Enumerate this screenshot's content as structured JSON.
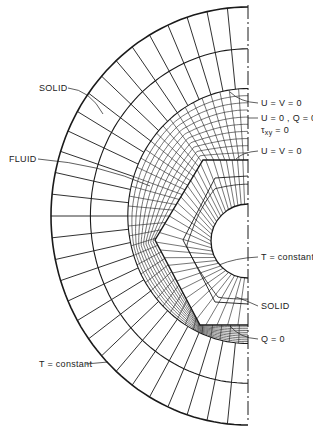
{
  "figure": {
    "colors": {
      "line": "#1a1a1a",
      "background": "#ffffff",
      "text": "#222222"
    },
    "geometry": {
      "center": [
        248,
        216
      ],
      "outer_rx": 197,
      "outer_ry": 209,
      "solid_arc_fractions": [
        1.0,
        0.8,
        0.61
      ],
      "solid_spokes": 30,
      "fluid_arcs": 9,
      "fluid_spokes": 40,
      "polygon": [
        [
          248,
          160
        ],
        [
          203,
          160
        ],
        [
          155,
          240
        ],
        [
          200,
          325
        ],
        [
          248,
          325
        ]
      ],
      "inner_polygon": [
        [
          248,
          176
        ],
        [
          215,
          178
        ],
        [
          183,
          240
        ],
        [
          215,
          302
        ],
        [
          248,
          304
        ]
      ],
      "hole_center": [
        248,
        241
      ],
      "hole_radius": 37
    }
  },
  "labels": {
    "solid_outer": "SOLID",
    "fluid": "FLUID",
    "t_constant_outer": "T = constant",
    "uv0_top": "U = V = 0",
    "u0_q0": "U = 0 , Q = 0",
    "txy0_tau": "τ",
    "txy0_sub": "xy",
    "txy0_rest": " = 0",
    "uv0_mid": "U = V = 0",
    "t_constant_inner": "T = constant",
    "solid_inner": "SOLID",
    "q0": "Q = 0"
  }
}
